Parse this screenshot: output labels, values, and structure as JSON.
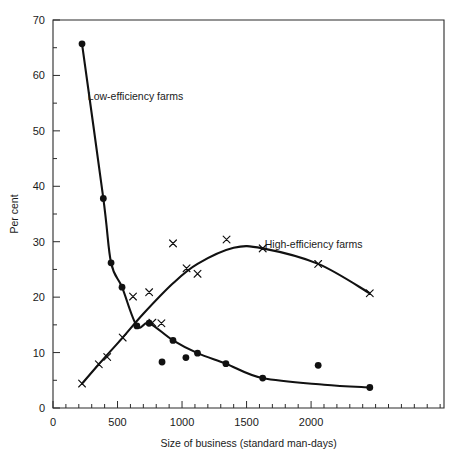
{
  "chart_data": {
    "type": "scatter",
    "title": "",
    "xlabel": "Size of business (standard man-days)",
    "ylabel": "Per cent",
    "xlim": [
      0,
      3030
    ],
    "ylim": [
      0,
      70
    ],
    "xticks": [
      0,
      500,
      1000,
      1500,
      2000
    ],
    "xticklabels": [
      "0",
      "500",
      "1000",
      "1500",
      "2000"
    ],
    "x_minor_step": 100,
    "yticks": [
      0,
      10,
      20,
      30,
      40,
      50,
      60,
      70
    ],
    "yticklabels": [
      "0",
      "10",
      "20",
      "30",
      "40",
      "50",
      "60",
      "70"
    ],
    "y_minor_step": 5,
    "grid": false,
    "legend_position": "inline-annotations",
    "annotations": [
      {
        "text": "Low-efficiency farms",
        "x": 640,
        "y": 55.5
      },
      {
        "text": "High-efficiency farms",
        "x": 2020,
        "y": 28.8
      }
    ],
    "series": [
      {
        "name": "Low-efficiency farms",
        "marker": "filled-circle",
        "points": [
          {
            "x": 225,
            "y": 65.7
          },
          {
            "x": 390,
            "y": 37.8
          },
          {
            "x": 450,
            "y": 26.2
          },
          {
            "x": 535,
            "y": 21.8
          },
          {
            "x": 650,
            "y": 14.8
          },
          {
            "x": 745,
            "y": 15.3
          },
          {
            "x": 845,
            "y": 8.3
          },
          {
            "x": 930,
            "y": 12.2
          },
          {
            "x": 1030,
            "y": 9.1
          },
          {
            "x": 1120,
            "y": 9.9
          },
          {
            "x": 1340,
            "y": 8.0
          },
          {
            "x": 1625,
            "y": 5.4
          },
          {
            "x": 2055,
            "y": 7.7
          },
          {
            "x": 2455,
            "y": 3.7
          }
        ],
        "fitted_curve": [
          {
            "x": 225,
            "y": 65.7
          },
          {
            "x": 390,
            "y": 37.8
          },
          {
            "x": 450,
            "y": 26.2
          },
          {
            "x": 535,
            "y": 21.8
          },
          {
            "x": 650,
            "y": 14.8
          },
          {
            "x": 745,
            "y": 15.3
          },
          {
            "x": 930,
            "y": 12.2
          },
          {
            "x": 1120,
            "y": 9.9
          },
          {
            "x": 1340,
            "y": 8.0
          },
          {
            "x": 1625,
            "y": 5.4
          },
          {
            "x": 2100,
            "y": 4.2
          },
          {
            "x": 2455,
            "y": 3.7
          }
        ]
      },
      {
        "name": "High-efficiency farms",
        "marker": "cross",
        "points": [
          {
            "x": 225,
            "y": 4.4
          },
          {
            "x": 355,
            "y": 7.9
          },
          {
            "x": 420,
            "y": 9.2
          },
          {
            "x": 540,
            "y": 12.7
          },
          {
            "x": 620,
            "y": 20.1
          },
          {
            "x": 745,
            "y": 20.9
          },
          {
            "x": 930,
            "y": 29.7
          },
          {
            "x": 1035,
            "y": 25.2
          },
          {
            "x": 1120,
            "y": 24.2
          },
          {
            "x": 1345,
            "y": 30.4
          },
          {
            "x": 1625,
            "y": 28.8
          },
          {
            "x": 2055,
            "y": 26.0
          },
          {
            "x": 2455,
            "y": 20.7
          },
          {
            "x": 770,
            "y": 15.4
          },
          {
            "x": 840,
            "y": 15.3
          }
        ],
        "fitted_curve": [
          {
            "x": 225,
            "y": 4.4
          },
          {
            "x": 355,
            "y": 7.9
          },
          {
            "x": 540,
            "y": 12.7
          },
          {
            "x": 700,
            "y": 17.0
          },
          {
            "x": 930,
            "y": 22.5
          },
          {
            "x": 1120,
            "y": 26.0
          },
          {
            "x": 1400,
            "y": 28.9
          },
          {
            "x": 1625,
            "y": 28.8
          },
          {
            "x": 2055,
            "y": 26.0
          },
          {
            "x": 2455,
            "y": 20.7
          }
        ]
      }
    ]
  }
}
